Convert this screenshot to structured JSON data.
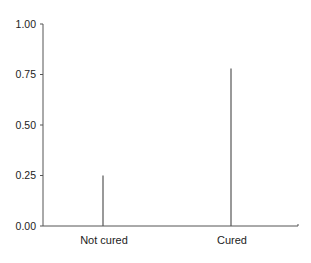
{
  "chart_data": {
    "type": "bar",
    "title": "",
    "xlabel": "",
    "ylabel": "",
    "categories": [
      "Not cured",
      "Cured"
    ],
    "values": [
      0.25,
      0.78
    ],
    "ylim": [
      0,
      1.0
    ],
    "yticks": [
      0.0,
      0.25,
      0.5,
      0.75,
      1.0
    ],
    "ytick_labels": [
      "0.00",
      "0.25",
      "0.50",
      "0.75",
      "1.00"
    ],
    "grid": false,
    "legend": null,
    "style": "spike/needle bars (thin vertical lines)",
    "colors": {
      "axis": "#555555",
      "bar": "#555555",
      "text": "#222222",
      "background": "#ffffff"
    }
  }
}
